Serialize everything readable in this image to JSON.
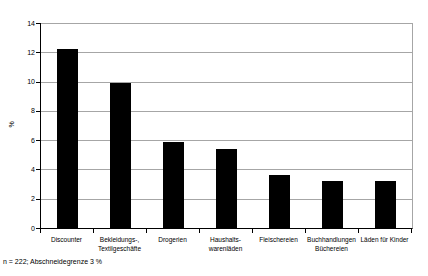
{
  "chart_data": {
    "type": "bar",
    "title": "",
    "xlabel": "",
    "ylabel": "%",
    "ylim": [
      0,
      14
    ],
    "yticks": [
      0,
      2,
      4,
      6,
      8,
      10,
      12,
      14
    ],
    "grid": true,
    "legend": "none",
    "categories": [
      "Discounter",
      "Bekleidungs-, Textilgeschäfte",
      "Drogerien",
      "Haushalts-warenläden",
      "Fleischereien",
      "Buchhandlungen Büchereien",
      "Läden für Kinder"
    ],
    "category_lines": [
      [
        "Discounter"
      ],
      [
        "Bekleidungs-,",
        "Textilgeschäfte"
      ],
      [
        "Drogerien"
      ],
      [
        "Haushalts-",
        "warenläden"
      ],
      [
        "Fleischereien"
      ],
      [
        "Buchhandlungen",
        "Büchereien"
      ],
      [
        "Läden für Kinder"
      ]
    ],
    "values": [
      12.2,
      9.9,
      5.9,
      5.4,
      3.6,
      3.2,
      3.2
    ],
    "bar_color": "#000000",
    "gridline_color": "#a6a6a6",
    "axis_color": "#000000"
  },
  "footnote": "n = 222; Abschneidegrenze 3 %"
}
